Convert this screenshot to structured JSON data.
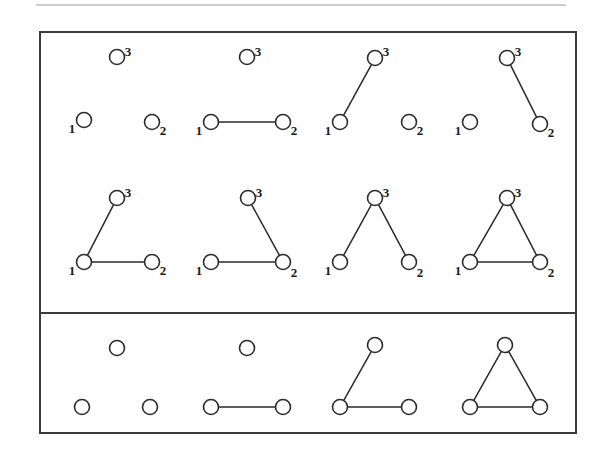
{
  "figure": {
    "background_color": "#ffffff",
    "ink_color": "#2b2b2b",
    "border_color": "#3a3a3a",
    "node_fill": "#ffffff",
    "top_rule": {
      "visible": true,
      "x1": 36,
      "x2": 566,
      "y": 5,
      "color": "#9a9a9a"
    },
    "outer_box": {
      "x": 40,
      "y": 32,
      "width": 536,
      "height": 401
    },
    "divider": {
      "x1": 40,
      "x2": 576,
      "y": 313
    },
    "panels": [
      {
        "name": "labeled-panel",
        "rows": 2
      },
      {
        "name": "unlabeled-panel",
        "rows": 1
      }
    ]
  },
  "labels": {
    "one": "1",
    "two": "2",
    "three": "3"
  },
  "graphs": {
    "labeled": [
      {
        "id": "labeled-g1",
        "row": 1,
        "column": 1,
        "edge_count": 0,
        "edges": [],
        "nodes": [
          {
            "label": "1",
            "cx": 84,
            "cy": 120,
            "r": 7.5,
            "label_x": 72,
            "label_y": 133
          },
          {
            "label": "2",
            "cx": 152,
            "cy": 122,
            "r": 7.5,
            "label_x": 163,
            "label_y": 135
          },
          {
            "label": "3",
            "cx": 117,
            "cy": 57,
            "r": 7.5,
            "label_x": 128,
            "label_y": 56
          }
        ]
      },
      {
        "id": "labeled-g2",
        "row": 1,
        "column": 2,
        "edge_count": 1,
        "edges": [
          [
            0,
            1
          ]
        ],
        "nodes": [
          {
            "label": "1",
            "cx": 211,
            "cy": 122,
            "r": 7.5,
            "label_x": 199,
            "label_y": 135
          },
          {
            "label": "2",
            "cx": 283,
            "cy": 122,
            "r": 7.5,
            "label_x": 294,
            "label_y": 135
          },
          {
            "label": "3",
            "cx": 247,
            "cy": 57,
            "r": 7.5,
            "label_x": 258,
            "label_y": 56
          }
        ]
      },
      {
        "id": "labeled-g3",
        "row": 1,
        "column": 3,
        "edge_count": 1,
        "edges": [
          [
            0,
            2
          ]
        ],
        "nodes": [
          {
            "label": "1",
            "cx": 340,
            "cy": 122,
            "r": 7.5,
            "label_x": 328,
            "label_y": 135
          },
          {
            "label": "2",
            "cx": 409,
            "cy": 122,
            "r": 7.5,
            "label_x": 420,
            "label_y": 135
          },
          {
            "label": "3",
            "cx": 375,
            "cy": 58,
            "r": 7.5,
            "label_x": 386,
            "label_y": 56
          }
        ]
      },
      {
        "id": "labeled-g4",
        "row": 1,
        "column": 4,
        "edge_count": 1,
        "edges": [
          [
            1,
            2
          ]
        ],
        "nodes": [
          {
            "label": "1",
            "cx": 470,
            "cy": 122,
            "r": 7.5,
            "label_x": 458,
            "label_y": 135
          },
          {
            "label": "2",
            "cx": 540,
            "cy": 124,
            "r": 7.5,
            "label_x": 551,
            "label_y": 137
          },
          {
            "label": "3",
            "cx": 507,
            "cy": 58,
            "r": 7.5,
            "label_x": 518,
            "label_y": 56
          }
        ]
      },
      {
        "id": "labeled-g5",
        "row": 2,
        "column": 1,
        "edge_count": 2,
        "edges": [
          [
            0,
            1
          ],
          [
            0,
            2
          ]
        ],
        "nodes": [
          {
            "label": "1",
            "cx": 84,
            "cy": 262,
            "r": 7.5,
            "label_x": 72,
            "label_y": 275
          },
          {
            "label": "2",
            "cx": 152,
            "cy": 262,
            "r": 7.5,
            "label_x": 163,
            "label_y": 275
          },
          {
            "label": "3",
            "cx": 117,
            "cy": 198,
            "r": 7.5,
            "label_x": 128,
            "label_y": 197
          }
        ]
      },
      {
        "id": "labeled-g6",
        "row": 2,
        "column": 2,
        "edge_count": 2,
        "edges": [
          [
            0,
            1
          ],
          [
            1,
            2
          ]
        ],
        "nodes": [
          {
            "label": "1",
            "cx": 211,
            "cy": 262,
            "r": 7.5,
            "label_x": 199,
            "label_y": 275
          },
          {
            "label": "2",
            "cx": 283,
            "cy": 262,
            "r": 7.5,
            "label_x": 294,
            "label_y": 277
          },
          {
            "label": "3",
            "cx": 248,
            "cy": 198,
            "r": 7.5,
            "label_x": 259,
            "label_y": 197
          }
        ]
      },
      {
        "id": "labeled-g7",
        "row": 2,
        "column": 3,
        "edge_count": 2,
        "edges": [
          [
            0,
            2
          ],
          [
            1,
            2
          ]
        ],
        "nodes": [
          {
            "label": "1",
            "cx": 340,
            "cy": 262,
            "r": 7.5,
            "label_x": 328,
            "label_y": 275
          },
          {
            "label": "2",
            "cx": 409,
            "cy": 262,
            "r": 7.5,
            "label_x": 420,
            "label_y": 277
          },
          {
            "label": "3",
            "cx": 375,
            "cy": 198,
            "r": 7.5,
            "label_x": 386,
            "label_y": 197
          }
        ]
      },
      {
        "id": "labeled-g8",
        "row": 2,
        "column": 4,
        "edge_count": 3,
        "edges": [
          [
            0,
            1
          ],
          [
            0,
            2
          ],
          [
            1,
            2
          ]
        ],
        "nodes": [
          {
            "label": "1",
            "cx": 470,
            "cy": 262,
            "r": 7.5,
            "label_x": 458,
            "label_y": 275
          },
          {
            "label": "2",
            "cx": 540,
            "cy": 262,
            "r": 7.5,
            "label_x": 551,
            "label_y": 277
          },
          {
            "label": "3",
            "cx": 507,
            "cy": 198,
            "r": 7.5,
            "label_x": 518,
            "label_y": 197
          }
        ]
      }
    ],
    "unlabeled": [
      {
        "id": "unlabeled-g1",
        "column": 1,
        "edge_count": 0,
        "edges": [],
        "nodes": [
          {
            "cx": 82,
            "cy": 407,
            "r": 7.5
          },
          {
            "cx": 150,
            "cy": 407,
            "r": 7.5
          },
          {
            "cx": 117,
            "cy": 348,
            "r": 7.5
          }
        ]
      },
      {
        "id": "unlabeled-g2",
        "column": 2,
        "edge_count": 1,
        "edges": [
          [
            0,
            1
          ]
        ],
        "nodes": [
          {
            "cx": 211,
            "cy": 407,
            "r": 7.5
          },
          {
            "cx": 283,
            "cy": 407,
            "r": 7.5
          },
          {
            "cx": 247,
            "cy": 348,
            "r": 7.5
          }
        ]
      },
      {
        "id": "unlabeled-g3",
        "column": 3,
        "edge_count": 2,
        "edges": [
          [
            0,
            1
          ],
          [
            0,
            2
          ]
        ],
        "nodes": [
          {
            "cx": 340,
            "cy": 407,
            "r": 7.5
          },
          {
            "cx": 409,
            "cy": 407,
            "r": 7.5
          },
          {
            "cx": 375,
            "cy": 345,
            "r": 7.5
          }
        ]
      },
      {
        "id": "unlabeled-g4",
        "column": 4,
        "edge_count": 3,
        "edges": [
          [
            0,
            1
          ],
          [
            0,
            2
          ],
          [
            1,
            2
          ]
        ],
        "nodes": [
          {
            "cx": 470,
            "cy": 407,
            "r": 7.5
          },
          {
            "cx": 540,
            "cy": 407,
            "r": 7.5
          },
          {
            "cx": 505,
            "cy": 345,
            "r": 7.5
          }
        ]
      }
    ]
  }
}
